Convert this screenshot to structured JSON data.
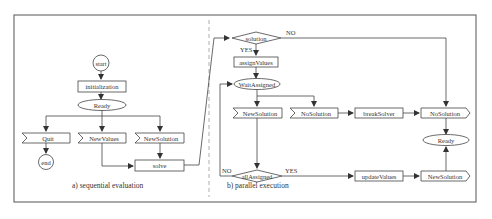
{
  "diagram": {
    "panel_a": {
      "caption": "a)  sequential evaluation",
      "nodes": {
        "start": "start",
        "initialization": "initialization",
        "ready": "Ready",
        "quit": "Quit",
        "new_values": "NewValues",
        "new_solution": "NewSolution",
        "end": "end",
        "solve": "solve"
      }
    },
    "panel_b": {
      "caption": "b)  parallel execution",
      "nodes": {
        "solution": "solution",
        "assign_values": "assignValues",
        "wait_assigned": "WaitAssigned",
        "new_solution_in": "NewSolution",
        "no_solution_in": "NoSolution",
        "break_solver": "breakSolver",
        "no_solution_out": "NoSolution",
        "ready": "Ready",
        "all_assigned": "allAssigned",
        "update_values": "updateValues",
        "new_solution_out": "NewSolution"
      },
      "edge_labels": {
        "solution_yes": "YES",
        "solution_no": "NO",
        "all_assigned_yes": "YES",
        "all_assigned_no": "NO"
      }
    }
  }
}
